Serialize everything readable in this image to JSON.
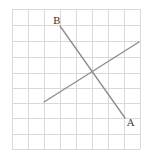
{
  "diagram": {
    "type": "grid-with-line-segments",
    "grid": {
      "columns": 8,
      "rows": 9,
      "x_lines": [
        12,
        28,
        44,
        60,
        76,
        92,
        108,
        124,
        140
      ],
      "y_lines": [
        9,
        25,
        41,
        57,
        73,
        88,
        103,
        118,
        134,
        149
      ],
      "color": "#d9d9d9"
    },
    "segments": [
      {
        "id": "segment-ab",
        "x1": 60,
        "y1": 26,
        "x2": 125,
        "y2": 118,
        "color": "#8c8c8c"
      },
      {
        "id": "segment-cd",
        "x1": 44,
        "y1": 102,
        "x2": 139,
        "y2": 42,
        "color": "#8c8c8c"
      }
    ],
    "labels": [
      {
        "id": "label-b",
        "text": "B",
        "x": 53,
        "y": 24
      },
      {
        "id": "label-a",
        "text": "A",
        "x": 127,
        "y": 126
      }
    ]
  }
}
